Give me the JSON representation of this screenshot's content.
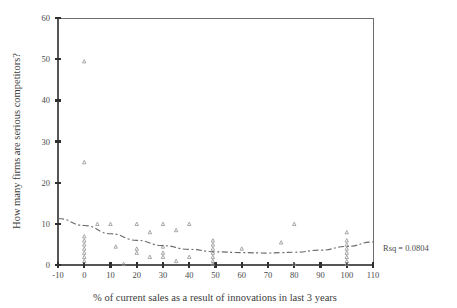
{
  "chart_data": {
    "type": "scatter",
    "title": "",
    "xlabel": "% of current sales as a result of innovations in last 3 years",
    "ylabel": "How many firms are serious competitors?",
    "xlim": [
      -10,
      110
    ],
    "ylim": [
      0,
      60
    ],
    "xticks": [
      -10,
      0,
      10,
      20,
      30,
      40,
      50,
      60,
      70,
      80,
      90,
      100,
      110
    ],
    "yticks": [
      0,
      10,
      20,
      30,
      40,
      50,
      60
    ],
    "xtick_labels": [
      "-10",
      "0",
      "10",
      "20",
      "30",
      "40",
      "50",
      "60",
      "70",
      "80",
      "90",
      "100",
      "110"
    ],
    "ytick_labels": [
      "0",
      "10",
      "20",
      "30",
      "40",
      "50",
      "60"
    ],
    "grid": false,
    "legend": false,
    "marker": "small-triangle",
    "marker_color": "#8e8e8e",
    "points": [
      [
        0,
        49.5
      ],
      [
        0,
        25.0
      ],
      [
        0,
        7.0
      ],
      [
        0,
        6.0
      ],
      [
        0,
        5.0
      ],
      [
        0,
        4.0
      ],
      [
        0,
        3.0
      ],
      [
        0,
        2.0
      ],
      [
        0,
        1.0
      ],
      [
        5,
        10.0
      ],
      [
        10,
        10.0
      ],
      [
        12,
        4.5
      ],
      [
        15,
        0.3
      ],
      [
        20,
        10.0
      ],
      [
        20,
        4.0
      ],
      [
        20,
        3.0
      ],
      [
        25,
        8.0
      ],
      [
        25,
        2.0
      ],
      [
        30,
        10.0
      ],
      [
        30,
        4.5
      ],
      [
        30,
        3.0
      ],
      [
        30,
        2.0
      ],
      [
        35,
        8.5
      ],
      [
        35,
        1.0
      ],
      [
        40,
        10.0
      ],
      [
        40,
        2.0
      ],
      [
        49,
        6.0
      ],
      [
        49,
        5.0
      ],
      [
        49,
        4.0
      ],
      [
        49,
        3.0
      ],
      [
        49,
        2.0
      ],
      [
        49,
        1.0
      ],
      [
        49,
        0.3
      ],
      [
        60,
        4.0
      ],
      [
        75,
        5.5
      ],
      [
        80,
        10.0
      ],
      [
        80,
        0.3
      ],
      [
        100,
        8.0
      ],
      [
        100,
        6.0
      ],
      [
        100,
        5.0
      ],
      [
        100,
        4.0
      ],
      [
        100,
        3.0
      ],
      [
        100,
        2.0
      ],
      [
        100,
        1.0
      ],
      [
        100,
        0.3
      ]
    ],
    "fit": {
      "type": "quadratic-smoothed",
      "style": "dash-dot",
      "color": "#6a6a6a",
      "x": [
        -10,
        0,
        10,
        20,
        30,
        40,
        50,
        60,
        70,
        75,
        80,
        90,
        100,
        110
      ],
      "y": [
        11.3,
        9.6,
        7.6,
        6.0,
        4.7,
        3.8,
        3.2,
        3.0,
        2.9,
        3.0,
        3.1,
        3.6,
        4.5,
        5.6
      ]
    },
    "annotations": [
      {
        "name": "rsq-label",
        "text": "Rsq = 0.0804",
        "x_px": 383,
        "y_px": 251
      }
    ]
  }
}
